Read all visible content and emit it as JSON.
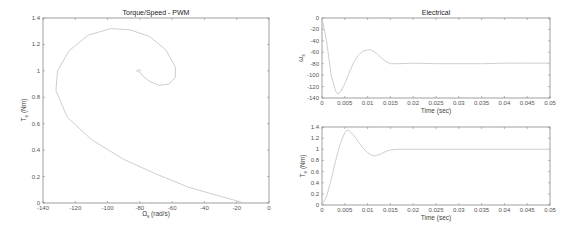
{
  "chart_data": [
    {
      "type": "line",
      "title": "Torque/Speed - PWM",
      "xlabel": "Ω_s (rad/s)",
      "ylabel": "T_e (Nm)",
      "xlim": [
        -140,
        0
      ],
      "ylim": [
        0,
        1.4
      ],
      "xticks": [
        "-140",
        "-120",
        "-100",
        "-80",
        "-60",
        "-40",
        "-20",
        "0"
      ],
      "yticks": [
        "0",
        "0.2",
        "0.4",
        "0.6",
        "0.8",
        "1",
        "1.2",
        "1.4"
      ],
      "grid": false,
      "series": [
        {
          "name": "trajectory",
          "x": [
            -15,
            -30,
            -50,
            -70,
            -90,
            -110,
            -125,
            -132,
            -131,
            -124,
            -112,
            -98,
            -86,
            -74,
            -64,
            -58,
            -58,
            -62,
            -68,
            -74,
            -78,
            -80,
            -82,
            -81,
            -79
          ],
          "y": [
            0,
            0.05,
            0.12,
            0.22,
            0.33,
            0.48,
            0.65,
            0.85,
            1.0,
            1.15,
            1.27,
            1.32,
            1.31,
            1.26,
            1.16,
            1.03,
            0.95,
            0.9,
            0.89,
            0.92,
            0.96,
            0.99,
            1.0,
            1.01,
            1.0
          ]
        }
      ]
    },
    {
      "type": "line",
      "title": "Electrical",
      "xlabel": "Time (sec)",
      "ylabel": "ω_s",
      "xlim": [
        0,
        0.05
      ],
      "ylim": [
        -140,
        0
      ],
      "xticks": [
        "0",
        "0.005",
        "0.01",
        "0.015",
        "0.02",
        "0.025",
        "0.03",
        "0.035",
        "0.04",
        "0.045",
        "0.05"
      ],
      "yticks": [
        "0",
        "-20",
        "-40",
        "-60",
        "-80",
        "-100",
        "-120",
        "-140"
      ],
      "grid": false,
      "series": [
        {
          "name": "speed",
          "x": [
            0,
            0.001,
            0.002,
            0.003,
            0.0035,
            0.004,
            0.005,
            0.006,
            0.007,
            0.008,
            0.009,
            0.0105,
            0.012,
            0.013,
            0.014,
            0.015,
            0.017,
            0.02,
            0.025,
            0.03,
            0.035,
            0.04,
            0.045,
            0.05
          ],
          "y": [
            0,
            -40,
            -100,
            -128,
            -133,
            -130,
            -115,
            -95,
            -77,
            -65,
            -58,
            -55,
            -62,
            -70,
            -76,
            -80,
            -80,
            -79,
            -80,
            -80,
            -80,
            -79,
            -79,
            -79
          ]
        }
      ]
    },
    {
      "type": "line",
      "title": "",
      "xlabel": "Time (sec)",
      "ylabel": "T_e (Nm)",
      "xlim": [
        0,
        0.05
      ],
      "ylim": [
        0,
        1.4
      ],
      "xticks": [
        "0",
        "0.005",
        "0.01",
        "0.015",
        "0.02",
        "0.025",
        "0.03",
        "0.035",
        "0.04",
        "0.045",
        "0.05"
      ],
      "yticks": [
        "0",
        "0.2",
        "0.4",
        "0.6",
        "0.8",
        "1",
        "1.2",
        "1.4"
      ],
      "grid": false,
      "series": [
        {
          "name": "torque",
          "x": [
            0,
            0.001,
            0.002,
            0.003,
            0.004,
            0.005,
            0.0055,
            0.006,
            0.007,
            0.008,
            0.009,
            0.01,
            0.011,
            0.0115,
            0.012,
            0.013,
            0.014,
            0.015,
            0.017,
            0.02,
            0.025,
            0.03,
            0.035,
            0.04,
            0.045,
            0.05
          ],
          "y": [
            0,
            0.15,
            0.45,
            0.8,
            1.1,
            1.3,
            1.35,
            1.33,
            1.25,
            1.13,
            1.02,
            0.94,
            0.89,
            0.88,
            0.89,
            0.92,
            0.96,
            0.99,
            1.0,
            1.0,
            1.0,
            1.0,
            1.0,
            1.0,
            1.0,
            1.0
          ]
        }
      ]
    }
  ],
  "charts": {
    "left": {
      "title": "Torque/Speed - PWM",
      "xlabel_main": "Ω",
      "xlabel_sub": "s",
      "xlabel_unit": " (rad/s)",
      "ylabel_main": "T",
      "ylabel_sub": "e",
      "ylabel_unit": " (Nm)"
    },
    "top_right": {
      "title": "Electrical",
      "xlabel": "Time (sec)",
      "ylabel_main": "ω",
      "ylabel_sub": "s"
    },
    "bottom_right": {
      "xlabel": "Time (sec)",
      "ylabel_main": "T",
      "ylabel_sub": "e",
      "ylabel_unit": " (Nm)"
    }
  },
  "colors": {
    "line": "#c8c8c8",
    "axis": "#888888",
    "text": "#444444"
  }
}
